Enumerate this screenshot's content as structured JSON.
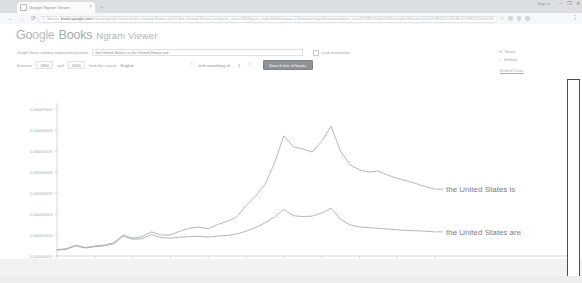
{
  "browser": {
    "tab": {
      "title": "Google Ngram Viewer",
      "favicon_name": "page-favicon",
      "close_label": "×"
    },
    "new_tab_label": "+",
    "nav": {
      "back": "←",
      "forward": "→",
      "reload": "⟳"
    },
    "omnibox": {
      "lock_icon": "⚿",
      "secure_label": "Secure",
      "url_domain": "books.google.com",
      "url_path": "/ngrams/graph?content=the+United+States+is%2Cthe+United+States+are&year_start=1800&year_end=2000&corpus=15&smoothing=3&share=&direct_url=t1%3B%2Cthe%20United%20States%20is%3B%2Cc0%3B.t1%3B%2Cthe%20United%20States%20are%3B%2Cc0",
      "star_icon": "☆"
    },
    "menu_icon": "⋮",
    "window": {
      "signin_label": "Sign in",
      "minimize": "–",
      "maximize": "❐",
      "close": "✕"
    }
  },
  "header": {
    "brand_go": "Go",
    "brand_ogle": "ogle",
    "brand_books": "Books",
    "product": "Ngram Viewer"
  },
  "controls": {
    "query_label": "Graph these comma-separated phrases:",
    "query_value": "the United States is,the United States are",
    "query_placeholder": "Enter comma-separated phrases",
    "case_insensitive_label": "case-insensitive",
    "between_label": "between",
    "year_start": "1800",
    "and_label": "and",
    "year_end": "2000",
    "corpus_label": "from the corpus",
    "corpus_value": "English",
    "smoothing_label": "with smoothing of",
    "smoothing_value": "3",
    "caret_icon": "▾",
    "search_button_label": "Search lots of books"
  },
  "chart_actions": {
    "share_icon": "➦",
    "share_label": "Share",
    "embed_icon": "‹›",
    "embed_label": "Embed",
    "embed_chart_link": "Embed Chart"
  },
  "chart_data": {
    "type": "line",
    "title": "",
    "xlabel": "",
    "ylabel": "",
    "xlim": [
      1800,
      2000
    ],
    "ylim": [
      0.0,
      7e-05
    ],
    "grid": false,
    "legend_position": "right",
    "x_ticks": [
      1800,
      1820,
      1840,
      1860,
      1880,
      1900,
      1920,
      1940,
      1960,
      1980,
      2000
    ],
    "x_tick_labels": [
      "1800",
      "1820",
      "1840",
      "1860",
      "1880",
      "1900",
      "1920",
      "1940",
      "1960",
      "1980",
      "2000"
    ],
    "y_ticks": [
      0.0,
      1e-05,
      2e-05,
      3e-05,
      4e-05,
      5e-05,
      6e-05,
      7e-05
    ],
    "y_tick_labels": [
      "0.0000000%",
      "0.0000100%",
      "0.0000200%",
      "0.0000300%",
      "0.0000400%",
      "0.0000500%",
      "0.0000600%",
      "0.0000700%"
    ],
    "line_color": "#9aa0a4",
    "series": [
      {
        "name": "the United States is",
        "label": "the United States is",
        "x": [
          1800,
          1805,
          1810,
          1815,
          1820,
          1825,
          1830,
          1835,
          1840,
          1845,
          1850,
          1855,
          1860,
          1865,
          1870,
          1875,
          1880,
          1885,
          1890,
          1895,
          1900,
          1905,
          1910,
          1915,
          1920,
          1925,
          1930,
          1935,
          1940,
          1945,
          1950,
          1955,
          1960,
          1965,
          1970,
          1975,
          1980,
          1985,
          1990,
          1995,
          2000
        ],
        "values": [
          3e-06,
          3.5e-06,
          5.2e-06,
          4e-06,
          4.8e-06,
          5.2e-06,
          6.3e-06,
          1e-05,
          8.5e-06,
          9.2e-06,
          1.15e-05,
          1e-05,
          1e-05,
          1.18e-05,
          1.32e-05,
          1.38e-05,
          1.3e-05,
          1.5e-05,
          1.65e-05,
          1.85e-05,
          2.4e-05,
          2.85e-05,
          3.4e-05,
          4.4e-05,
          5.72e-05,
          5.2e-05,
          5.1e-05,
          4.95e-05,
          5.45e-05,
          6.18e-05,
          5e-05,
          4.35e-05,
          4.1e-05,
          4e-05,
          4.05e-05,
          3.85e-05,
          3.7e-05,
          3.58e-05,
          3.45e-05,
          3.3e-05,
          3.18e-05
        ]
      },
      {
        "name": "the United States are",
        "label": "the United States are",
        "x": [
          1800,
          1805,
          1810,
          1815,
          1820,
          1825,
          1830,
          1835,
          1840,
          1845,
          1850,
          1855,
          1860,
          1865,
          1870,
          1875,
          1880,
          1885,
          1890,
          1895,
          1900,
          1905,
          1910,
          1915,
          1920,
          1925,
          1930,
          1935,
          1940,
          1945,
          1950,
          1955,
          1960,
          1965,
          1970,
          1975,
          1980,
          1985,
          1990,
          1995,
          2000
        ],
        "values": [
          2.8e-06,
          3.2e-06,
          4.8e-06,
          3.8e-06,
          4.4e-06,
          4.8e-06,
          5.8e-06,
          9.5e-06,
          8e-06,
          8.2e-06,
          1.02e-05,
          8.8e-06,
          8.5e-06,
          9e-06,
          9.2e-06,
          9.4e-06,
          9e-06,
          9.5e-06,
          9.8e-06,
          1.05e-05,
          1.18e-05,
          1.35e-05,
          1.58e-05,
          1.85e-05,
          2.22e-05,
          1.92e-05,
          1.88e-05,
          1.9e-05,
          2.05e-05,
          2.28e-05,
          1.75e-05,
          1.48e-05,
          1.38e-05,
          1.35e-05,
          1.32e-05,
          1.28e-05,
          1.25e-05,
          1.22e-05,
          1.2e-05,
          1.18e-05,
          1.15e-05
        ]
      }
    ]
  }
}
